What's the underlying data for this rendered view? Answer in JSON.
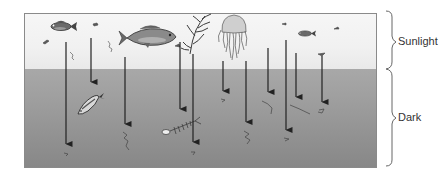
{
  "diagram": {
    "zones": [
      {
        "name": "Sunlight",
        "label": "Sunlight",
        "color": "#f3f3f3"
      },
      {
        "name": "Dark",
        "label": "Dark",
        "color": "#9a9a9a"
      }
    ],
    "organisms": [
      {
        "name": "small-fish",
        "zone": "Sunlight"
      },
      {
        "name": "large-fish",
        "zone": "Sunlight"
      },
      {
        "name": "kelp",
        "zone": "Sunlight"
      },
      {
        "name": "jellyfish",
        "zone": "Sunlight"
      },
      {
        "name": "small-fish-right",
        "zone": "Sunlight"
      },
      {
        "name": "plankton-particles",
        "zone": "Sunlight"
      },
      {
        "name": "dead-fish",
        "zone": "Dark"
      },
      {
        "name": "fish-skeleton",
        "zone": "Dark"
      },
      {
        "name": "detritus-particles",
        "zone": "Dark"
      }
    ],
    "arrows": [
      {
        "x": 66,
        "y1": 42,
        "y2": 150
      },
      {
        "x": 91,
        "y1": 38,
        "y2": 88
      },
      {
        "x": 125,
        "y1": 57,
        "y2": 130
      },
      {
        "x": 180,
        "y1": 42,
        "y2": 115
      },
      {
        "x": 193,
        "y1": 54,
        "y2": 148
      },
      {
        "x": 223,
        "y1": 61,
        "y2": 97
      },
      {
        "x": 246,
        "y1": 61,
        "y2": 128
      },
      {
        "x": 268,
        "y1": 48,
        "y2": 98
      },
      {
        "x": 286,
        "y1": 40,
        "y2": 136
      },
      {
        "x": 296,
        "y1": 53,
        "y2": 103
      },
      {
        "x": 322,
        "y1": 56,
        "y2": 108
      }
    ],
    "arrow_color": "#222222",
    "brace_color": "#666666"
  }
}
